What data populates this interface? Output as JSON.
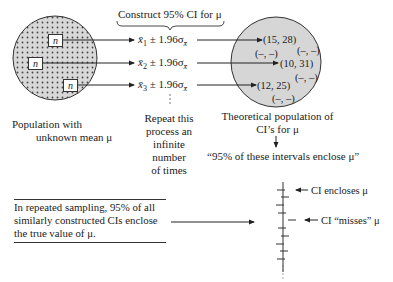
{
  "header": {
    "brace_label": "Construct 95% CI for μ"
  },
  "left_population": {
    "sample_label": "n",
    "caption_line1": "Population with",
    "caption_line2": "unknown mean μ"
  },
  "formulas": [
    {
      "xbar": "x̄",
      "sub": "1",
      "rest": " ± 1.96σ",
      "sigma_sub": "x̄"
    },
    {
      "xbar": "x̄",
      "sub": "2",
      "rest": " ± 1.96σ",
      "sigma_sub": "x̄"
    },
    {
      "xbar": "x̄",
      "sub": "3",
      "rest": " ± 1.96σ",
      "sigma_sub": "x̄"
    }
  ],
  "repeat_text": [
    "Repeat this",
    "process an",
    "infinite",
    "number",
    "of times"
  ],
  "right_population": {
    "intervals": {
      "i1": "(15, 28)",
      "i2": "(10, 31)",
      "i3": "(12, 25)",
      "blank": "(–, –)"
    },
    "caption_line1": "Theoretical population of",
    "caption_line2": "CI’s for μ",
    "quote": "“95% of these intervals enclose μ”"
  },
  "note": {
    "text": "In repeated sampling, 95% of all similarly constructed CIs enclose the true value of μ."
  },
  "interval_plot": {
    "label_encloses": "CI encloses μ",
    "label_misses": "CI “misses” μ"
  },
  "colors": {
    "circle_fill": "#d6d6d6",
    "stroke": "#333333",
    "dot": "#444444"
  }
}
